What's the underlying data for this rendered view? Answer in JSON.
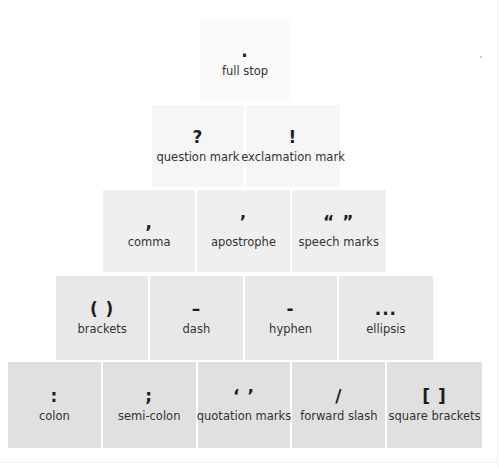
{
  "rows": [
    {
      "cells": [
        {
          "symbol": ".",
          "label": "full stop"
        }
      ]
    },
    {
      "cells": [
        {
          "symbol": "?",
          "label": "question mark"
        },
        {
          "symbol": "!",
          "label": "exclamation mark"
        }
      ]
    },
    {
      "cells": [
        {
          "symbol": ",",
          "label": "comma"
        },
        {
          "symbol": "’",
          "label": "apostrophe"
        },
        {
          "symbol": "“ ”",
          "label": "speech marks"
        }
      ]
    },
    {
      "cells": [
        {
          "symbol": "( )",
          "label": "brackets"
        },
        {
          "symbol": "–",
          "label": "dash"
        },
        {
          "symbol": "-",
          "label": "hyphen"
        },
        {
          "symbol": "...",
          "label": "ellipsis"
        }
      ]
    },
    {
      "cells": [
        {
          "symbol": ":",
          "label": "colon"
        },
        {
          "symbol": ";",
          "label": "semi-colon"
        },
        {
          "symbol": "‘ ’",
          "label": "quotation marks"
        },
        {
          "symbol": "/",
          "label": "forward slash"
        },
        {
          "symbol": "[ ]",
          "label": "square brackets"
        }
      ]
    }
  ]
}
